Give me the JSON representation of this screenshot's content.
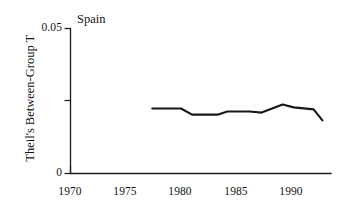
{
  "chart_data": {
    "type": "line",
    "title": "Spain",
    "xlabel": "",
    "ylabel": "Theil's Between-Group T",
    "xlim": [
      1970,
      1994.8
    ],
    "ylim": [
      0,
      0.05
    ],
    "grid": false,
    "legend": "none",
    "x_ticks": [
      1970,
      1975,
      1980,
      1985,
      1990
    ],
    "x_tick_labels": [
      "1970",
      "1975",
      "1980",
      "1985",
      "1990"
    ],
    "x_ticks_drawn": [
      1970
    ],
    "y_ticks": [
      0,
      0.025,
      0.05
    ],
    "y_tick_labels": [
      "0",
      "",
      "0.05"
    ],
    "series": [
      {
        "name": "Spain",
        "x": [
          1977.4,
          1980.0,
          1981.0,
          1983.3,
          1984.2,
          1986.2,
          1987.3,
          1989.2,
          1990.2,
          1992.0,
          1992.8
        ],
        "values": [
          0.0224,
          0.0224,
          0.0203,
          0.0203,
          0.0214,
          0.0214,
          0.021,
          0.0238,
          0.0228,
          0.0221,
          0.0183
        ]
      }
    ],
    "line_color": "#171717"
  },
  "axes": {
    "y_top_label": "0.05",
    "y_zero_label": "0",
    "x_labels": [
      "1970",
      "1975",
      "1980",
      "1985",
      "1990"
    ],
    "ylabel_text": "Theil's Between-Group T",
    "panel_label": "Spain"
  }
}
